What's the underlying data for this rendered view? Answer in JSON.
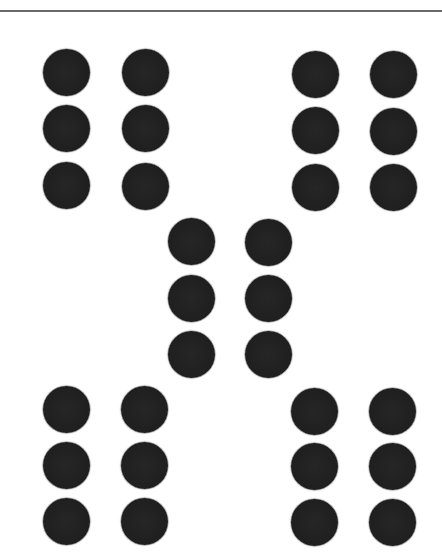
{
  "figure": {
    "background_color": "#ffffff",
    "rule_color": "#6a6a6a",
    "dot_color": "#222222",
    "dot_diameter": 47,
    "groups": [
      {
        "name": "top-left",
        "dots": [
          {
            "cx": 66,
            "cy": 72
          },
          {
            "cx": 145,
            "cy": 72
          },
          {
            "cx": 66,
            "cy": 128
          },
          {
            "cx": 145,
            "cy": 128
          },
          {
            "cx": 66,
            "cy": 185
          },
          {
            "cx": 145,
            "cy": 186
          }
        ]
      },
      {
        "name": "top-right",
        "dots": [
          {
            "cx": 315,
            "cy": 74
          },
          {
            "cx": 393,
            "cy": 74
          },
          {
            "cx": 315,
            "cy": 130
          },
          {
            "cx": 393,
            "cy": 131
          },
          {
            "cx": 315,
            "cy": 187
          },
          {
            "cx": 393,
            "cy": 187
          }
        ]
      },
      {
        "name": "center",
        "dots": [
          {
            "cx": 191,
            "cy": 241
          },
          {
            "cx": 268,
            "cy": 242
          },
          {
            "cx": 191,
            "cy": 298
          },
          {
            "cx": 268,
            "cy": 298
          },
          {
            "cx": 191,
            "cy": 354
          },
          {
            "cx": 268,
            "cy": 354
          }
        ]
      },
      {
        "name": "bottom-left",
        "dots": [
          {
            "cx": 66,
            "cy": 409
          },
          {
            "cx": 144,
            "cy": 409
          },
          {
            "cx": 66,
            "cy": 465
          },
          {
            "cx": 144,
            "cy": 465
          },
          {
            "cx": 66,
            "cy": 521
          },
          {
            "cx": 144,
            "cy": 521
          }
        ]
      },
      {
        "name": "bottom-right",
        "dots": [
          {
            "cx": 314,
            "cy": 411
          },
          {
            "cx": 392,
            "cy": 411
          },
          {
            "cx": 314,
            "cy": 466
          },
          {
            "cx": 392,
            "cy": 466
          },
          {
            "cx": 314,
            "cy": 522
          },
          {
            "cx": 392,
            "cy": 522
          }
        ]
      }
    ]
  }
}
